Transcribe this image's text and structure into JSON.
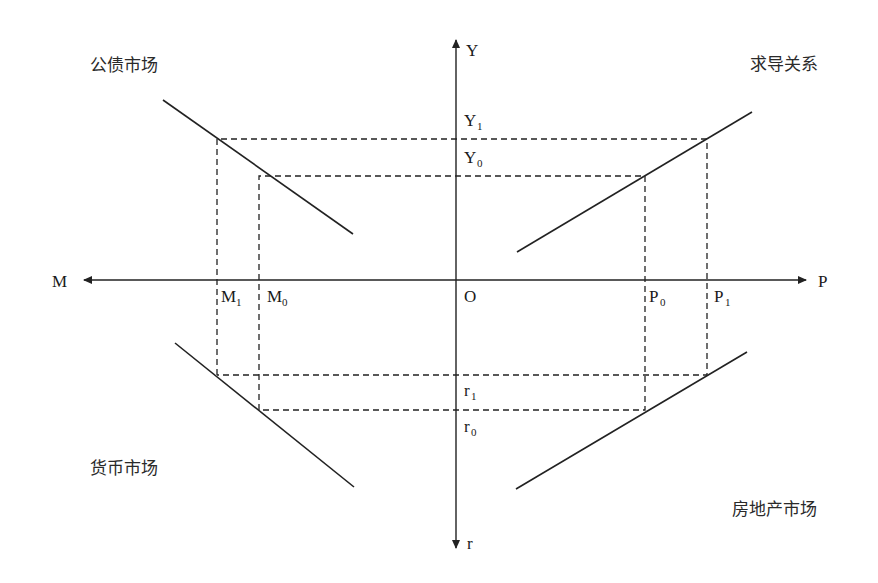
{
  "diagram": {
    "quadrant_labels": {
      "top_left": "公债市场",
      "top_right": "求导关系",
      "bottom_left": "货币市场",
      "bottom_right": "房地产市场"
    },
    "axes": {
      "up": "Y",
      "down": "r",
      "left": "M",
      "right": "P",
      "origin": "O"
    },
    "ticks": {
      "y1": {
        "base": "Y",
        "sub": "1"
      },
      "y0": {
        "base": "Y",
        "sub": "0"
      },
      "r1": {
        "base": "r",
        "sub": "1"
      },
      "r0": {
        "base": "r",
        "sub": "0"
      },
      "m1": {
        "base": "M",
        "sub": "1"
      },
      "m0": {
        "base": "M",
        "sub": "0"
      },
      "p0": {
        "base": "P",
        "sub": "0"
      },
      "p1": {
        "base": "P",
        "sub": "1"
      }
    },
    "colors": {
      "line": "#222222",
      "background": "#ffffff"
    }
  }
}
